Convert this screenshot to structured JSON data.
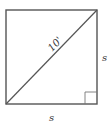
{
  "diagram": {
    "diagonal_label": "10'",
    "side_right_label": "s",
    "side_bottom_label": "s",
    "stroke_color": "#555555",
    "label_color": "#333333",
    "right_angle_marker": true
  }
}
